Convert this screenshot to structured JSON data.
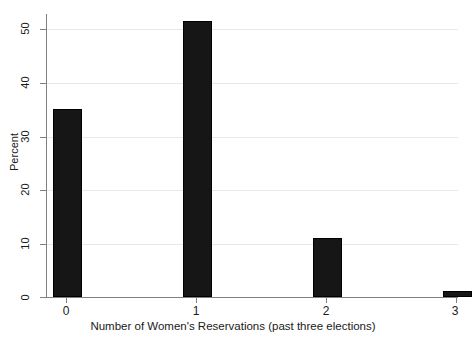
{
  "chart_data": {
    "type": "bar",
    "title": "",
    "subtitle": "",
    "xlabel": "Number of Women's Reservations (past three elections)",
    "ylabel": "Percent",
    "categories": [
      "0",
      "1",
      "2",
      "3"
    ],
    "values": [
      35.2,
      51.7,
      11.0,
      1.1
    ],
    "series": [
      {
        "name": "Percent",
        "values": [
          35.2,
          51.7,
          11.0,
          1.1
        ]
      }
    ],
    "xlim": [
      -0.5,
      3.5
    ],
    "ylim": [
      0,
      53
    ],
    "ytick_labels": [
      "0",
      "10",
      "20",
      "30",
      "40",
      "50"
    ],
    "ytick_values": [
      0,
      10,
      20,
      30,
      40,
      50
    ],
    "xtick_labels": [
      "0",
      "1",
      "2",
      "3"
    ],
    "xtick_values": [
      0,
      1,
      2,
      3
    ],
    "grid": "horizontal",
    "legend": "none",
    "bar_color": "#161616",
    "grid_color": "#e8e8e8",
    "axis_color": "#808080",
    "background_color": "#ffffff",
    "annotations": []
  }
}
